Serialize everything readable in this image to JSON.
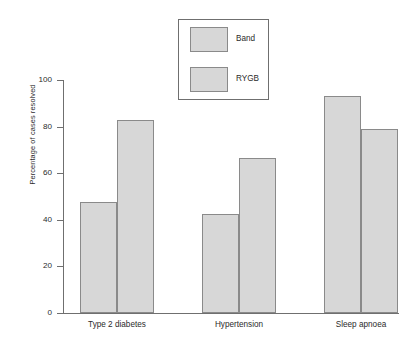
{
  "chart_data": {
    "type": "bar",
    "title": "",
    "subtitle": "",
    "xlabel": "",
    "ylabel": "Percentage of cases resolved",
    "ylim": [
      0,
      100
    ],
    "yticks": [
      "0",
      "20",
      "40",
      "60",
      "80",
      "100"
    ],
    "ytick_values": [
      0,
      20,
      40,
      60,
      80,
      100
    ],
    "grid": false,
    "legend_position": "top-center",
    "categories": [
      "Type 2 diabetes",
      "Hypertension",
      "Sleep apnoea"
    ],
    "series": [
      {
        "name": "Band",
        "values": [
          47.5,
          42.5,
          93.0
        ]
      },
      {
        "name": "RYGB",
        "values": [
          83.0,
          66.5,
          79.0
        ]
      }
    ],
    "colors": {
      "bar_fill": "#d7d7d7",
      "bar_stroke": "#8a8a8a",
      "axis": "#6f6f6f",
      "text": "#2b2b2b",
      "background": "#ffffff"
    }
  },
  "legend": {
    "items": [
      {
        "label": "Band"
      },
      {
        "label": "RYGB"
      }
    ]
  }
}
